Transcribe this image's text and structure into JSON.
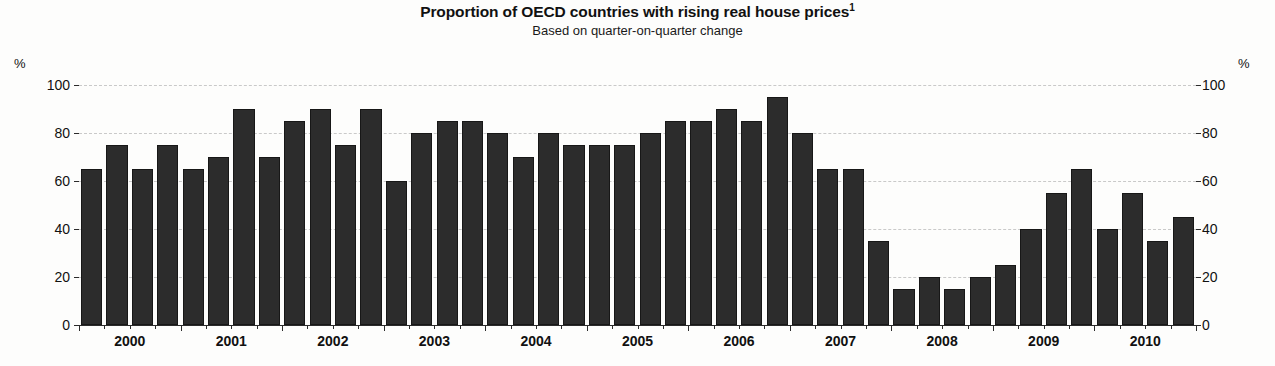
{
  "header": {
    "title": "Proportion of OECD countries with rising real house prices",
    "title_superscript": "1",
    "subtitle": "Based on quarter-on-quarter change"
  },
  "axis": {
    "unit_left": "%",
    "unit_right": "%",
    "y_ticks": [
      "100",
      "80",
      "60",
      "40",
      "20",
      "0"
    ],
    "x_ticks": [
      "2000",
      "2001",
      "2002",
      "2003",
      "2004",
      "2005",
      "2006",
      "2007",
      "2008",
      "2009",
      "2010"
    ]
  },
  "colors": {
    "bar": "#2c2c2c",
    "gridline": "#c9c9c9",
    "axis": "#2b2b2b",
    "background": "#fdfdfc",
    "text": "#111111"
  },
  "chart_data": {
    "type": "bar",
    "title": "Proportion of OECD countries with rising real house prices",
    "subtitle": "Based on quarter-on-quarter change",
    "xlabel": "",
    "ylabel": "%",
    "ylim": [
      0,
      100
    ],
    "ytick_values": [
      0,
      20,
      40,
      60,
      80,
      100
    ],
    "grid": true,
    "legend": "none",
    "x_axis_year_labels": [
      "2000",
      "2001",
      "2002",
      "2003",
      "2004",
      "2005",
      "2006",
      "2007",
      "2008",
      "2009",
      "2010"
    ],
    "categories": [
      "2000 Q1",
      "2000 Q2",
      "2000 Q3",
      "2000 Q4",
      "2001 Q1",
      "2001 Q2",
      "2001 Q3",
      "2001 Q4",
      "2002 Q1",
      "2002 Q2",
      "2002 Q3",
      "2002 Q4",
      "2003 Q1",
      "2003 Q2",
      "2003 Q3",
      "2003 Q4",
      "2004 Q1",
      "2004 Q2",
      "2004 Q3",
      "2004 Q4",
      "2005 Q1",
      "2005 Q2",
      "2005 Q3",
      "2005 Q4",
      "2006 Q1",
      "2006 Q2",
      "2006 Q3",
      "2006 Q4",
      "2007 Q1",
      "2007 Q2",
      "2007 Q3",
      "2007 Q4",
      "2008 Q1",
      "2008 Q2",
      "2008 Q3",
      "2008 Q4",
      "2009 Q1",
      "2009 Q2",
      "2009 Q3",
      "2009 Q4",
      "2010 Q1",
      "2010 Q2",
      "2010 Q3",
      "2010 Q4"
    ],
    "values": [
      65,
      75,
      65,
      75,
      65,
      70,
      90,
      70,
      85,
      90,
      75,
      90,
      60,
      80,
      85,
      85,
      80,
      70,
      80,
      75,
      75,
      75,
      80,
      85,
      85,
      90,
      85,
      95,
      80,
      65,
      65,
      35,
      15,
      20,
      15,
      20,
      25,
      40,
      55,
      65,
      40,
      55,
      35,
      45
    ]
  }
}
